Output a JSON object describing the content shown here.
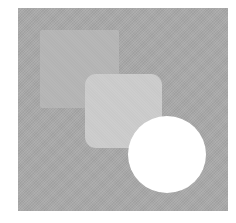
{
  "graphic": {
    "description": "Abstract composition of overlapping grayscale shapes",
    "frame": {
      "color": "#a9a9a9"
    },
    "shapes": [
      {
        "name": "back-square",
        "type": "square",
        "color": "#b3b3b3"
      },
      {
        "name": "middle-rounded-square",
        "type": "rounded-square",
        "color": "#c9c9c9"
      },
      {
        "name": "front-circle",
        "type": "circle",
        "color": "#ffffff"
      }
    ]
  }
}
